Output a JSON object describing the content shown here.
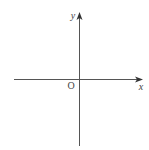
{
  "diagram": {
    "type": "coordinate-axes",
    "origin_label": "O",
    "x_axis_label": "x",
    "y_axis_label": "y",
    "colors": {
      "axis": "#555555",
      "text": "#444444",
      "background": "#ffffff"
    }
  }
}
